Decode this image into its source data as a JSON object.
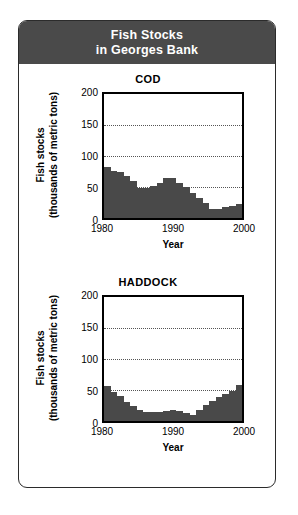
{
  "card": {
    "header": {
      "line1": "Fish Stocks",
      "line2": "in Georges Bank",
      "background_color": "#4a4a4a",
      "text_color": "#ffffff"
    },
    "border_color": "#2b2b2b"
  },
  "axis": {
    "y_label_line1": "Fish stocks",
    "y_label_line2": "(thousands of metric tons)",
    "x_label": "Year",
    "y_ticks": [
      "200",
      "150",
      "100",
      "50",
      "0"
    ],
    "x_ticks": [
      "1980",
      "1990",
      "2000"
    ]
  },
  "chart_data": [
    {
      "type": "area",
      "title": "COD",
      "xlabel": "Year",
      "ylabel": "Fish stocks (thousands of metric tons)",
      "ylim": [
        0,
        200
      ],
      "xlim": [
        1980,
        2000
      ],
      "yticks": [
        0,
        50,
        100,
        150,
        200
      ],
      "xticks": [
        1980,
        1990,
        2000
      ],
      "gridlines": [
        50,
        100,
        150
      ],
      "grid": true,
      "legend": "none",
      "series_color": "#494949",
      "x": [
        1980,
        1981,
        1982,
        1983,
        1984,
        1985,
        1986,
        1987,
        1988,
        1989,
        1990,
        1991,
        1992,
        1993,
        1994,
        1995,
        1996,
        1997,
        1998,
        1999,
        2000
      ],
      "values": [
        82,
        76,
        75,
        68,
        60,
        49,
        48,
        52,
        56,
        64,
        65,
        57,
        50,
        40,
        32,
        24,
        14,
        15,
        17,
        20,
        23
      ]
    },
    {
      "type": "area",
      "title": "HADDOCK",
      "xlabel": "Year",
      "ylabel": "Fish stocks (thousands of metric tons)",
      "ylim": [
        0,
        200
      ],
      "xlim": [
        1980,
        2000
      ],
      "yticks": [
        0,
        50,
        100,
        150,
        200
      ],
      "xticks": [
        1980,
        1990,
        2000
      ],
      "gridlines": [
        50,
        100,
        150
      ],
      "grid": true,
      "legend": "none",
      "series_color": "#494949",
      "x": [
        1980,
        1981,
        1982,
        1983,
        1984,
        1985,
        1986,
        1987,
        1988,
        1989,
        1990,
        1991,
        1992,
        1993,
        1994,
        1995,
        1996,
        1997,
        1998,
        1999,
        2000
      ],
      "values": [
        57,
        46,
        40,
        30,
        24,
        17,
        15,
        14,
        14,
        16,
        17,
        16,
        13,
        10,
        17,
        26,
        33,
        39,
        44,
        49,
        58
      ]
    }
  ]
}
